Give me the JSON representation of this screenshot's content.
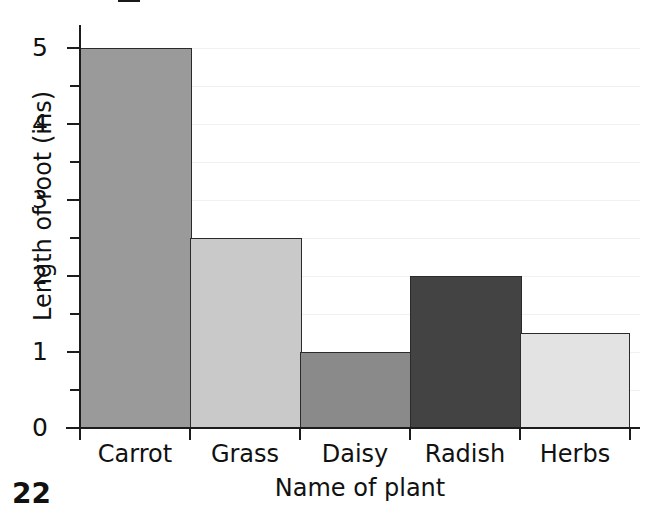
{
  "page": {
    "number": "22"
  },
  "chart_data": {
    "type": "bar",
    "title": "",
    "categories": [
      "Carrot",
      "Grass",
      "Daisy",
      "Radish",
      "Herbs"
    ],
    "values": [
      5,
      2.5,
      1,
      2,
      1.25
    ],
    "xlabel": "Name of plant",
    "ylabel": "Length of root (ins)",
    "ylim": [
      0,
      5
    ],
    "y_ticks": [
      0,
      1,
      2,
      3,
      4,
      5
    ],
    "y_tick_labels": [
      "0",
      "1",
      "2",
      "3",
      "4",
      "5"
    ],
    "y_minor_tick_interval": 0.5,
    "grid": true,
    "grid_interval": 0.5,
    "grid_color": "#f1f1f1",
    "legend": false,
    "bar_colors": [
      "#9a9a9a",
      "#c9c9c9",
      "#8a8a8a",
      "#434343",
      "#e3e3e3"
    ],
    "bar_edge_color": "#2b2b2b",
    "axis_color": "#1c1c1c",
    "text_color": "#111111",
    "background": "#ffffff"
  }
}
